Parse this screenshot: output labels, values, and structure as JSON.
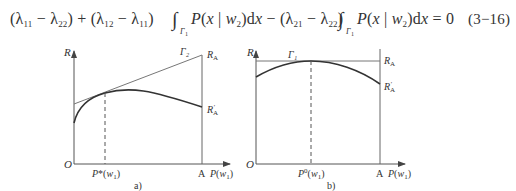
{
  "equation": {
    "text": "(λ₁₁ − λ₂₂) + (λ₁₂ − λ₁₁) ∫Γ₁ P(x | w₂) dx − (λ₂₁ − λ₂₂) ∫Γ₁ P(x | w₂) dx = 0",
    "number": "(3−16)"
  },
  "figure_a": {
    "y_axis_label": "R",
    "origin_label": "O",
    "x_axis_label": "P(w₁)",
    "end_label": "A",
    "tangent_label": "Γ₂",
    "top_right_label": "R_A",
    "curve_end_label": "R'_A",
    "tangent_point_label": "P*(w₁)",
    "caption": "a)"
  },
  "figure_b": {
    "y_axis_label": "R",
    "origin_label": "O",
    "x_axis_label": "P(w₁)",
    "end_label": "A",
    "tangent_label": "Γ₁",
    "top_right_label": "R_A",
    "curve_end_label": "R'_A",
    "tangent_point_label": "P⁰(w₁)",
    "caption": "b)"
  }
}
